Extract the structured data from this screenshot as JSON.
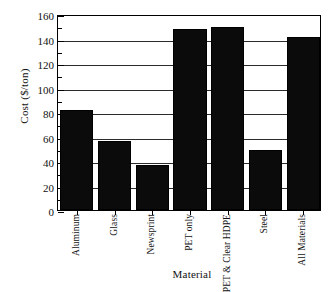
{
  "chart_data": {
    "type": "bar",
    "title": "",
    "subtitle": "",
    "xlabel": "Material",
    "ylabel": "Cost ($/ton)",
    "categories": [
      "Aluminum",
      "Glass",
      "Newsprint",
      "PET only",
      "PET & Clear HDPE",
      "Steel",
      "All Materials"
    ],
    "values": [
      82,
      56,
      37,
      148,
      149,
      49,
      141
    ],
    "ylim": [
      0,
      160
    ],
    "ytick_values": [
      0,
      20,
      40,
      60,
      80,
      100,
      120,
      140,
      160
    ],
    "ytick_labels": [
      "0",
      "20",
      "40",
      "60",
      "80",
      "100",
      "120",
      "140",
      "160"
    ],
    "yminor_tick_values": [
      10,
      30,
      50,
      70,
      90,
      110,
      130,
      150
    ],
    "grid": "horizontal",
    "legend": "none",
    "bar_color": "#0b0b0b",
    "axis_color": "#000000",
    "grid_color": "#2b2b2b",
    "background_color": "#ffffff",
    "xtick_rotation": 90,
    "bar_width_fraction": 0.88
  }
}
